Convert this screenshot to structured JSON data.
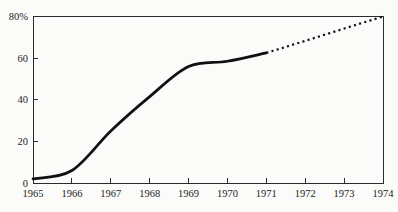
{
  "figure": {
    "background": "#fbfbfa",
    "axis_color": "#2b2b2b",
    "label_color": "#1c1c1c"
  },
  "chart_data": {
    "type": "line",
    "title": "",
    "xlabel": "",
    "ylabel": "",
    "xlim": [
      1965,
      1974
    ],
    "ylim": [
      0,
      80
    ],
    "grid": false,
    "frame": "full-box",
    "legend": "none",
    "x_tick_labels": [
      "1965",
      "1966",
      "1967",
      "1968",
      "1969",
      "1970",
      "1971",
      "1972",
      "1973",
      "1974"
    ],
    "x_tick_values": [
      1965,
      1966,
      1967,
      1968,
      1969,
      1970,
      1971,
      1972,
      1973,
      1974
    ],
    "y_ticks": [
      {
        "value": 0,
        "label": "0"
      },
      {
        "value": 20,
        "label": "20"
      },
      {
        "value": 40,
        "label": "40"
      },
      {
        "value": 60,
        "label": "60"
      },
      {
        "value": 80,
        "label": "80%"
      }
    ],
    "line_color": "#101010",
    "series": [
      {
        "name": "actual",
        "style": "solid",
        "x": [
          1965,
          1966,
          1967,
          1968,
          1969,
          1970,
          1971
        ],
        "values": [
          2,
          6,
          25,
          41.5,
          56,
          58.5,
          62.5
        ]
      },
      {
        "name": "projected",
        "style": "dotted",
        "x": [
          1971,
          1972,
          1973,
          1974
        ],
        "values": [
          62.5,
          68.3,
          74.2,
          80
        ]
      }
    ]
  }
}
